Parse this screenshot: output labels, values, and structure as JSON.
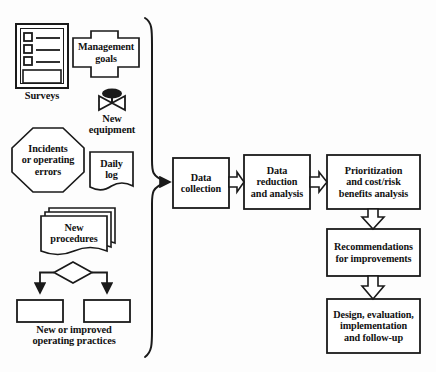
{
  "diagram": {
    "stroke_color": "#1a1a1a",
    "fill_color": "#ffffff",
    "background": "#fdfdfd"
  },
  "inputs": {
    "group_name": "data sources grouped by brace",
    "surveys": {
      "label": "Surveys",
      "icon": "survey-checklist-icon",
      "checkbox_rows": 3
    },
    "management_goals": {
      "label": "Management\ngoals",
      "shape": "cross"
    },
    "new_equipment": {
      "label": "New\nequipment",
      "icon": "valve-icon"
    },
    "incidents": {
      "label": "Incidents\nor operating\nerrors",
      "shape": "octagon"
    },
    "daily_log": {
      "label": "Daily\nlog",
      "shape": "document"
    },
    "new_procedures": {
      "label": "New\nprocedures",
      "shape": "stacked-documents",
      "stack_count": 3
    },
    "decision": {
      "label": "",
      "shape": "diamond"
    },
    "outcome_box_left": {
      "label": ""
    },
    "outcome_box_right": {
      "label": ""
    },
    "practices": {
      "label": "New or improved\noperating practices"
    }
  },
  "process": {
    "steps": [
      {
        "id": "data-collection",
        "label": "Data\ncollection"
      },
      {
        "id": "data-reduction",
        "label": "Data\nreduction\nand analysis"
      },
      {
        "id": "prioritization",
        "label": "Prioritization\nand cost/risk\nbenefits analysis"
      },
      {
        "id": "recommendations",
        "label": "Recommendations\nfor improvements"
      },
      {
        "id": "design",
        "label": "Design, evaluation,\nimplementation\nand follow-up"
      }
    ]
  }
}
